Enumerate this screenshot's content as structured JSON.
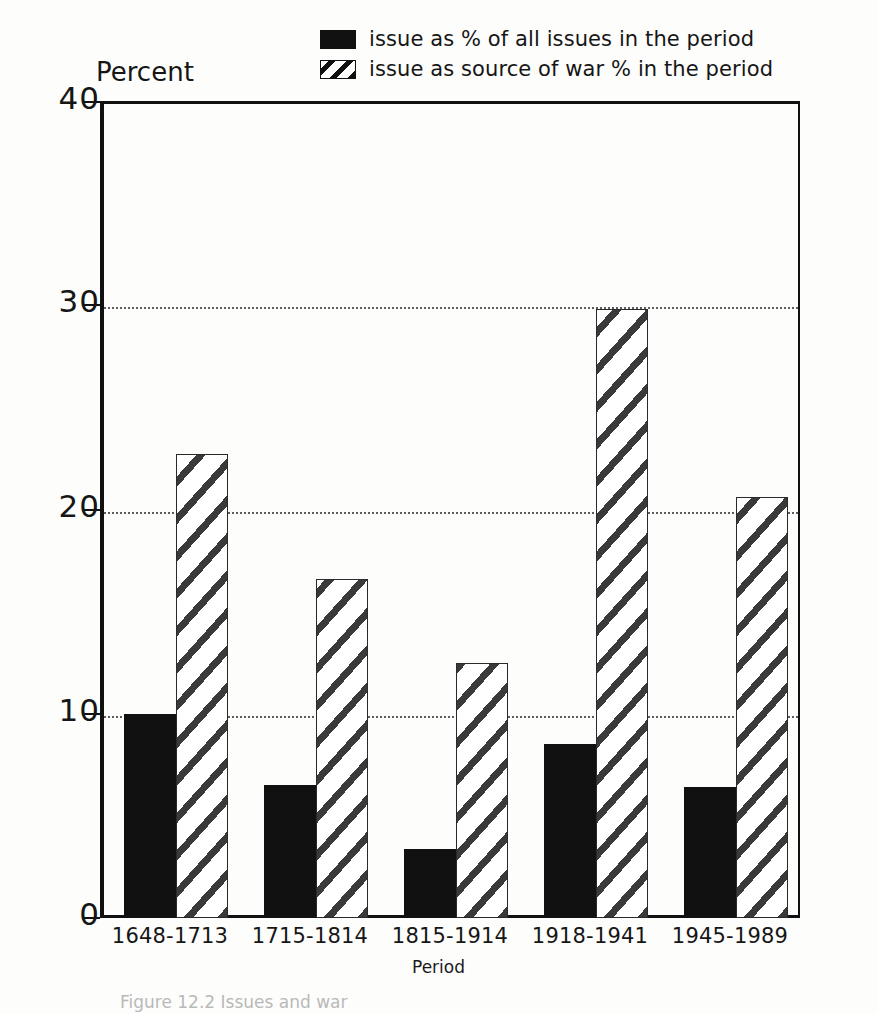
{
  "legend": {
    "position": "top-center",
    "entries": [
      {
        "swatch": "solid-black-swatch",
        "label": "issue as % of all issues in the period"
      },
      {
        "swatch": "diagonal-hatch-swatch",
        "label": "issue as source of war % in the period"
      }
    ]
  },
  "axes": {
    "y_title": "Percent",
    "x_title": "Period",
    "y_ticks": [
      "40",
      "30",
      "20",
      "10",
      "0"
    ]
  },
  "caption": "Figure 12.2  Issues and war",
  "colors": {
    "series1_fill": "#111111",
    "series2_fill": "#ffffff",
    "hatch_stroke": "#3a3a3a",
    "axis": "#111111",
    "grid": "#5d5d5d"
  },
  "chart_data": {
    "type": "bar",
    "title": "",
    "xlabel": "Period",
    "ylabel": "Percent",
    "ylim": [
      0,
      40
    ],
    "yticks": [
      0,
      10,
      20,
      30,
      40
    ],
    "grid": true,
    "legend_position": "top-center",
    "categories": [
      "1648-1713",
      "1715-1814",
      "1815-1914",
      "1918-1941",
      "1945-1989"
    ],
    "series": [
      {
        "name": "issue as % of all issues in the period",
        "style": "solid-black",
        "values": [
          10.0,
          6.5,
          3.4,
          8.5,
          6.4
        ]
      },
      {
        "name": "issue as source of war % in the period",
        "style": "diagonal-hatch",
        "values": [
          22.7,
          16.6,
          12.5,
          29.8,
          20.6
        ]
      }
    ]
  }
}
